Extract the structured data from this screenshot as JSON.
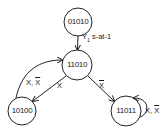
{
  "diagram": {
    "type": "state-transition-graph",
    "nodes": [
      {
        "id": "01010",
        "label": "01010",
        "cx": 78,
        "cy": 22,
        "r": 14
      },
      {
        "id": "11010",
        "label": "11010",
        "cx": 77,
        "cy": 65,
        "r": 15
      },
      {
        "id": "10100",
        "label": "10100",
        "cx": 22,
        "cy": 111,
        "r": 14
      },
      {
        "id": "11011",
        "label": "11011",
        "cx": 126,
        "cy": 111,
        "r": 15
      }
    ],
    "edges": [
      {
        "from": "01010",
        "to": "11010",
        "label_main": "Y",
        "label_sub": "1",
        "label_rest": " s-at-1"
      },
      {
        "from": "11010",
        "to": "10100",
        "label": "X"
      },
      {
        "from": "10100",
        "to": "11010",
        "label_a": "X, ",
        "label_b": "X"
      },
      {
        "from": "11010",
        "to": "11011",
        "label": "X"
      },
      {
        "from": "11011",
        "to": "11011",
        "label_a": "X, ",
        "label_b": "X"
      }
    ],
    "colors": {
      "stroke": "#222222",
      "background": "#ffffff"
    }
  }
}
